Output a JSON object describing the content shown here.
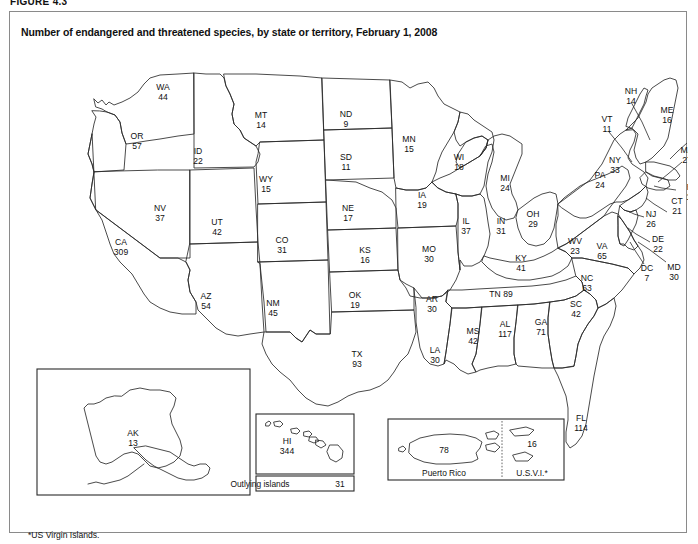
{
  "figure": {
    "label": "FIGURE 4.3",
    "title": "Number of endangered and threatened species, by state or territory, February 1, 2008",
    "footnote": "*US Virgin Islands."
  },
  "chart_data": {
    "type": "map",
    "title": "Number of endangered and threatened species, by state or territory, February 1, 2008",
    "value_label": "Number of endangered and threatened species",
    "date": "February 1, 2008",
    "categories": [
      "WA",
      "OR",
      "ID",
      "MT",
      "WY",
      "NV",
      "UT",
      "CO",
      "CA",
      "AZ",
      "NM",
      "ND",
      "SD",
      "NE",
      "KS",
      "OK",
      "TX",
      "MN",
      "IA",
      "MO",
      "AR",
      "LA",
      "WI",
      "IL",
      "MI",
      "IN",
      "OH",
      "KY",
      "TN",
      "MS",
      "AL",
      "GA",
      "FL",
      "SC",
      "NC",
      "VA",
      "WV",
      "PA",
      "NY",
      "VT",
      "NH",
      "ME",
      "MA",
      "RI",
      "CT",
      "NJ",
      "DE",
      "MD",
      "DC",
      "AK",
      "HI",
      "Outlying islands",
      "Puerto Rico",
      "U.S.V.I."
    ],
    "values": [
      44,
      57,
      22,
      14,
      15,
      37,
      42,
      31,
      309,
      54,
      45,
      9,
      11,
      17,
      16,
      19,
      93,
      15,
      19,
      30,
      30,
      30,
      18,
      37,
      24,
      31,
      29,
      41,
      89,
      42,
      117,
      71,
      114,
      42,
      63,
      65,
      23,
      24,
      33,
      11,
      14,
      16,
      27,
      18,
      21,
      26,
      22,
      30,
      7,
      13,
      344,
      31,
      78,
      16
    ],
    "states": [
      {
        "abbr": "WA",
        "value": 44,
        "x": 153,
        "y": 78
      },
      {
        "abbr": "OR",
        "value": 57,
        "x": 127,
        "y": 127
      },
      {
        "abbr": "ID",
        "value": 22,
        "x": 188,
        "y": 142
      },
      {
        "abbr": "MT",
        "value": 14,
        "x": 251,
        "y": 106
      },
      {
        "abbr": "WY",
        "value": 15,
        "x": 256,
        "y": 170
      },
      {
        "abbr": "NV",
        "value": 37,
        "x": 150,
        "y": 199
      },
      {
        "abbr": "UT",
        "value": 42,
        "x": 207,
        "y": 213
      },
      {
        "abbr": "CO",
        "value": 31,
        "x": 272,
        "y": 231
      },
      {
        "abbr": "CA",
        "value": 309,
        "x": 111,
        "y": 233
      },
      {
        "abbr": "AZ",
        "value": 54,
        "x": 196,
        "y": 287
      },
      {
        "abbr": "NM",
        "value": 45,
        "x": 263,
        "y": 294
      },
      {
        "abbr": "ND",
        "value": 9,
        "x": 336,
        "y": 105
      },
      {
        "abbr": "SD",
        "value": 11,
        "x": 336,
        "y": 148
      },
      {
        "abbr": "NE",
        "value": 17,
        "x": 338,
        "y": 199
      },
      {
        "abbr": "KS",
        "value": 16,
        "x": 355,
        "y": 241
      },
      {
        "abbr": "OK",
        "value": 19,
        "x": 345,
        "y": 286
      },
      {
        "abbr": "TX",
        "value": 93,
        "x": 347,
        "y": 345
      },
      {
        "abbr": "MN",
        "value": 15,
        "x": 399,
        "y": 130
      },
      {
        "abbr": "IA",
        "value": 19,
        "x": 412,
        "y": 186
      },
      {
        "abbr": "MO",
        "value": 30,
        "x": 419,
        "y": 240
      },
      {
        "abbr": "AR",
        "value": 30,
        "x": 422,
        "y": 290
      },
      {
        "abbr": "LA",
        "value": 30,
        "x": 425,
        "y": 341
      },
      {
        "abbr": "WI",
        "value": 18,
        "x": 449,
        "y": 148
      },
      {
        "abbr": "IL",
        "value": 37,
        "x": 456,
        "y": 212
      },
      {
        "abbr": "MI",
        "value": 24,
        "x": 495,
        "y": 169
      },
      {
        "abbr": "IN",
        "value": 31,
        "x": 491,
        "y": 212
      },
      {
        "abbr": "OH",
        "value": 29,
        "x": 523,
        "y": 205
      },
      {
        "abbr": "KY",
        "value": 41,
        "x": 511,
        "y": 249
      },
      {
        "abbr": "TN",
        "value": 89,
        "x": 491,
        "y": 285,
        "inline": true
      },
      {
        "abbr": "MS",
        "value": 42,
        "x": 463,
        "y": 322
      },
      {
        "abbr": "AL",
        "value": 117,
        "x": 495,
        "y": 315
      },
      {
        "abbr": "GA",
        "value": 71,
        "x": 531,
        "y": 313
      },
      {
        "abbr": "FL",
        "value": 114,
        "x": 571,
        "y": 409
      },
      {
        "abbr": "SC",
        "value": 42,
        "x": 566,
        "y": 295
      },
      {
        "abbr": "NC",
        "value": 63,
        "x": 577,
        "y": 269
      },
      {
        "abbr": "VA",
        "value": 65,
        "x": 592,
        "y": 237
      },
      {
        "abbr": "WV",
        "value": 23,
        "x": 565,
        "y": 232
      },
      {
        "abbr": "PA",
        "value": 24,
        "x": 590,
        "y": 166
      },
      {
        "abbr": "NY",
        "value": 33,
        "x": 605,
        "y": 151
      },
      {
        "abbr": "VT",
        "value": 11,
        "x": 597,
        "y": 110
      },
      {
        "abbr": "NH",
        "value": 14,
        "x": 621,
        "y": 82
      },
      {
        "abbr": "ME",
        "value": 16,
        "x": 657,
        "y": 101
      },
      {
        "abbr": "MA",
        "value": 27,
        "x": 677,
        "y": 141
      },
      {
        "abbr": "RI",
        "value": 18,
        "x": 681,
        "y": 178
      },
      {
        "abbr": "CT",
        "value": 21,
        "x": 667,
        "y": 192
      },
      {
        "abbr": "NJ",
        "value": 26,
        "x": 641,
        "y": 205
      },
      {
        "abbr": "DE",
        "value": 22,
        "x": 648,
        "y": 230
      },
      {
        "abbr": "MD",
        "value": 30,
        "x": 664,
        "y": 258
      },
      {
        "abbr": "DC",
        "value": 7,
        "x": 637,
        "y": 259
      }
    ],
    "insets": [
      {
        "name": "alaska",
        "abbr": "AK",
        "value": 13,
        "label_x": 123,
        "label_y": 424
      },
      {
        "name": "hawaii",
        "abbr": "HI",
        "value": 344,
        "label_x": 277,
        "label_y": 432,
        "caption": "Outlying islands",
        "caption_value": "31"
      },
      {
        "name": "caribbean",
        "regions": [
          {
            "caption": "Puerto Rico",
            "value": 78
          },
          {
            "caption": "U.S.V.I.*",
            "value": 16
          }
        ]
      }
    ]
  }
}
